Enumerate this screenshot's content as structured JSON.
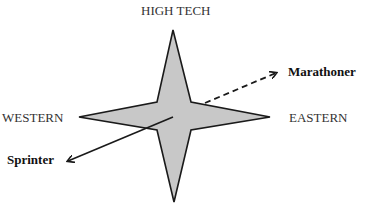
{
  "diagram": {
    "axes": {
      "top": "HIGH TECH",
      "left": "WESTERN",
      "right": "EASTERN"
    },
    "arrows": [
      {
        "label": "Marathoner",
        "style": "dashed"
      },
      {
        "label": "Sprinter",
        "style": "solid"
      }
    ],
    "colors": {
      "star_fill": "#c8c8c8",
      "stroke": "#1a1a1a"
    }
  }
}
